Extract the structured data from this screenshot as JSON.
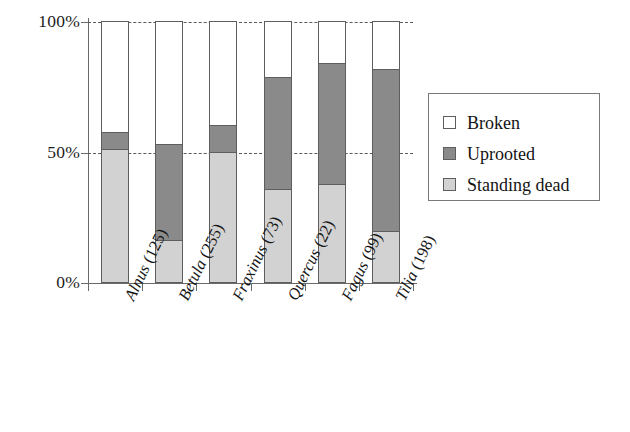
{
  "chart_data": {
    "type": "bar",
    "subtype": "stacked-percentage",
    "title": "",
    "xlabel": "",
    "ylabel": "",
    "ylim": [
      0,
      100
    ],
    "yticks": [
      "0%",
      "50%",
      "100%"
    ],
    "ytick_values": [
      0,
      50,
      100
    ],
    "grid": "horizontal-dashed",
    "legend_position": "right",
    "categories": [
      "Alnus (125)",
      "Betula (255)",
      "Fraxinus (73)",
      "Quercus (22)",
      "Fagus (99)",
      "Tilia (198)"
    ],
    "category_genus": [
      "Alnus",
      "Betula",
      "Fraxinus",
      "Quercus",
      "Fagus",
      "Tilia"
    ],
    "category_counts": [
      "(125)",
      "(255)",
      "(73)",
      "(22)",
      "(99)",
      "(198)"
    ],
    "series": [
      {
        "name": "Standing dead",
        "color": "#d2d2d2",
        "values": [
          51,
          16,
          50,
          35.5,
          37.5,
          19.5
        ]
      },
      {
        "name": "Uprooted",
        "color": "#8a8a8a",
        "values": [
          6.5,
          37,
          10,
          43,
          46.5,
          62
        ]
      },
      {
        "name": "Broken",
        "color": "#ffffff",
        "values": [
          42.5,
          47,
          40,
          21.5,
          16,
          18.5
        ]
      }
    ]
  },
  "legend": {
    "items": [
      {
        "label": "Broken",
        "color": "#ffffff"
      },
      {
        "label": "Uprooted",
        "color": "#8a8a8a"
      },
      {
        "label": "Standing dead",
        "color": "#d2d2d2"
      }
    ]
  },
  "colors": {
    "broken": "#ffffff",
    "uprooted": "#8a8a8a",
    "standing_dead": "#d2d2d2",
    "axis": "#6a6a6a",
    "gridline": "#5a5a5a",
    "bar_outline": "#5e5e5e",
    "text": "#161616",
    "background": "#ffffff"
  }
}
